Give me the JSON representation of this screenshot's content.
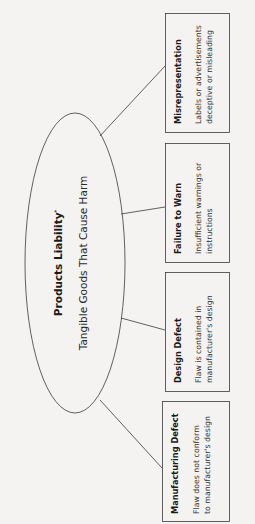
{
  "diagram": {
    "center": {
      "title": "Products Liability",
      "title_mark": "*",
      "subtitle": "Tangible Goods That Cause Harm"
    },
    "categories": [
      {
        "title": "Misrepresentation",
        "description_line1": "Labels or advertisements",
        "description_line2": "deceptive or misleading"
      },
      {
        "title": "Failure to Warn",
        "description_line1": "Insufficient warnings or",
        "description_line2": "instructions"
      },
      {
        "title": "Design Defect",
        "description_line1": "Flaw is contained in",
        "description_line2": "manufacturer's design"
      },
      {
        "title": "Manufacturing Defect",
        "description_line1": "Flaw does not conform",
        "description_line2": "to manufacturer's design"
      }
    ],
    "colors": {
      "background": "#f4f3f1",
      "stroke": "#3a3a3a",
      "text": "#1a1a1a"
    }
  }
}
